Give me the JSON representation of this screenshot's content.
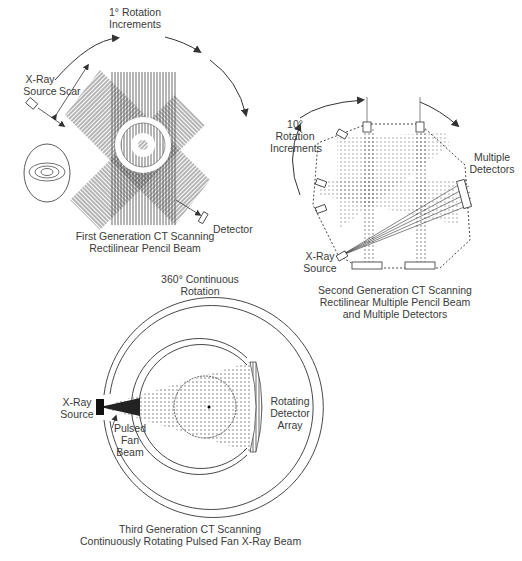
{
  "figure": {
    "panels": [
      {
        "id": "first-generation",
        "caption": [
          "First Generation CT Scanning",
          "Rectilinear Pencil Beam"
        ],
        "labels": {
          "rotation": [
            "1° Rotation",
            "Increments"
          ],
          "source": [
            "X-Ray",
            "Source"
          ],
          "scan": "Scar",
          "detector": "Detector"
        }
      },
      {
        "id": "second-generation",
        "caption": [
          "Second Generation CT Scanning",
          "Rectilinear Multiple Pencil Beam",
          "and Multiple Detectors"
        ],
        "labels": {
          "rotation": [
            "10°",
            "Rotation",
            "Increments"
          ],
          "detectors": [
            "Multiple",
            "Detectors"
          ],
          "source": [
            "X-Ray",
            "Source"
          ]
        }
      },
      {
        "id": "third-generation",
        "caption": [
          "Third Generation CT Scanning",
          "Continuously Rotating Pulsed Fan X-Ray Beam"
        ],
        "labels": {
          "rotation": [
            "360° Continuous",
            "Rotation"
          ],
          "source": [
            "X-Ray",
            "Source"
          ],
          "beam": [
            "Pulsed",
            "Fan",
            "Beam"
          ],
          "detector": [
            "Rotating",
            "Detector",
            "Array"
          ]
        }
      }
    ],
    "line_color": "#333333",
    "background": "#ffffff"
  }
}
